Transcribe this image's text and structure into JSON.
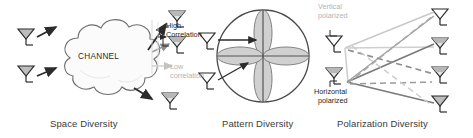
{
  "figure": {
    "background": "#ffffff",
    "panels": [
      {
        "id": "space",
        "caption": "Space Diversity",
        "channel_label": "CHANNEL",
        "labels": [
          {
            "name": "high-correlation-label",
            "text": "High\nCorrelation",
            "color": "#1f1f1f"
          },
          {
            "name": "low-correlation-label",
            "text": "Low\ncorrelation",
            "color": "#b4b4b4"
          }
        ]
      },
      {
        "id": "pattern",
        "caption": "Pattern Diversity",
        "labels": []
      },
      {
        "id": "polarization",
        "caption": "Polarization Diversity",
        "labels": [
          {
            "name": "vertical-polarized-label",
            "text": "Vertical\npolarized",
            "color": "#b4b4b4"
          },
          {
            "name": "horizontal-polarized-label",
            "text": "Horizontal\npolarized",
            "color": "#1f1f1f"
          }
        ]
      }
    ],
    "captions": {
      "space": "Space Diversity",
      "pattern": "Pattern Diversity",
      "polarization": "Polarization Diversity"
    },
    "text": {
      "channel": "CHANNEL",
      "high_line1": "High",
      "high_line2": "Correlation",
      "low_line1": "Low",
      "low_line2": "correlation",
      "vertical_line1": "Vertical",
      "vertical_line2": "polarized",
      "horizontal_line1": "Horizontal",
      "horizontal_line2": "polarized"
    },
    "colors": {
      "stroke_dark": "#2b2b2b",
      "stroke_mid": "#7d7d7d",
      "stroke_light": "#c3c3c3",
      "fill_gray": "#bdbdbd",
      "fill_light": "#dcdcdc",
      "text_dark": "#1f1f1f",
      "text_gray": "#b4b4b4",
      "caption": "#3a3a3a"
    },
    "counts": {
      "space_tx_antennas": 2,
      "space_rx_antennas": 3,
      "pattern_antennas": 2,
      "polarization_tx_antennas": 2,
      "polarization_rx_antennas": 4
    }
  }
}
